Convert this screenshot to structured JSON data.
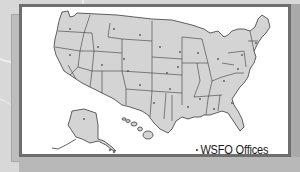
{
  "legend": {
    "label": "WSFO Offices",
    "marker": "office-dot"
  },
  "map": {
    "subject": "United States with state borders",
    "insets": [
      "Alaska",
      "Hawaii"
    ],
    "colors": {
      "land": "#d4d4d4",
      "border": "#3a3a3a",
      "frame": "#6e6e6e",
      "background": "#d8d8d8",
      "office_dot": "#555555"
    }
  }
}
